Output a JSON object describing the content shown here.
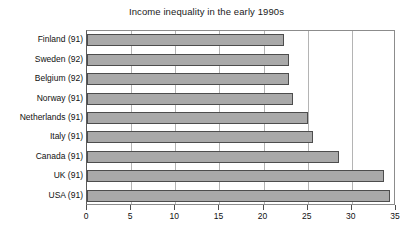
{
  "chart_data": {
    "type": "bar",
    "orientation": "horizontal",
    "title": "Income inequality in the early 1990s",
    "xlabel": "",
    "ylabel": "",
    "categories": [
      "Finland (91)",
      "Sweden (92)",
      "Belgium (92)",
      "Norway (91)",
      "Netherlands (91)",
      "Italy (91)",
      "Canada (91)",
      "UK (91)",
      "USA (91)"
    ],
    "values": [
      22.3,
      22.9,
      22.9,
      23.3,
      25.0,
      25.6,
      28.5,
      33.6,
      34.3
    ],
    "xlim": [
      0,
      35
    ],
    "xticks": [
      0,
      5,
      10,
      15,
      20,
      25,
      30,
      35
    ],
    "xtick_labels": [
      "0",
      "5",
      "10",
      "15",
      "20",
      "25",
      "30",
      "35"
    ],
    "grid": true,
    "grid_axis": "x",
    "legend": false,
    "bar_color": "#a9a9a9",
    "bar_edge_color": "#4d4d4d",
    "grid_color": "#b4b4b4",
    "frame_color": "#8c8c8c",
    "background_color": "#ffffff",
    "text_color": "#111111"
  }
}
